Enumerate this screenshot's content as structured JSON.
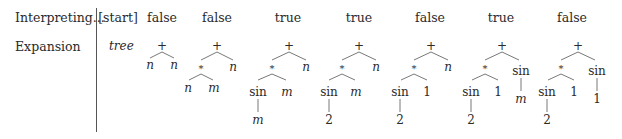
{
  "rows": {
    "interpreting_label": "Interpreting...",
    "expansion_label": "Expansion"
  },
  "columns": [
    {
      "header": "[start]",
      "x": 118
    },
    {
      "header": "false",
      "x": 162
    },
    {
      "header": "false",
      "x": 217
    },
    {
      "header": "true",
      "x": 288
    },
    {
      "header": "true",
      "x": 359
    },
    {
      "header": "false",
      "x": 430
    },
    {
      "header": "true",
      "x": 501
    },
    {
      "header": "false",
      "x": 572
    }
  ],
  "start_expansion": "tree",
  "trees": [
    {
      "column": 1,
      "expression": "n + n"
    },
    {
      "column": 2,
      "expression": "(n * m) + n"
    },
    {
      "column": 3,
      "expression": "(sin(m) * m) + n"
    },
    {
      "column": 4,
      "expression": "(sin(2) * m) + n"
    },
    {
      "column": 5,
      "expression": "(sin(2) * 1) + n"
    },
    {
      "column": 6,
      "expression": "(sin(2) * 1) + sin(m)"
    },
    {
      "column": 7,
      "expression": "(sin(2) * 1) + sin(1)"
    }
  ],
  "symbols": {
    "plus": "+",
    "times": "*",
    "sin": "sin",
    "n": "n",
    "m": "m",
    "two": "2",
    "one": "1"
  }
}
